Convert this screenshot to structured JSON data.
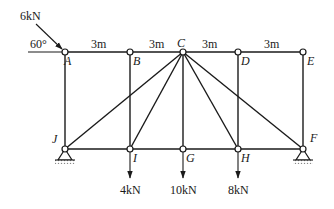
{
  "diagram": {
    "type": "truss",
    "nodes": {
      "top": [
        "A",
        "B",
        "C",
        "D",
        "E"
      ],
      "bottom": [
        "J",
        "I",
        "G",
        "H",
        "F"
      ]
    },
    "members": [
      [
        "A",
        "B"
      ],
      [
        "B",
        "C"
      ],
      [
        "C",
        "D"
      ],
      [
        "D",
        "E"
      ],
      [
        "J",
        "I"
      ],
      [
        "I",
        "G"
      ],
      [
        "G",
        "H"
      ],
      [
        "H",
        "F"
      ],
      [
        "A",
        "J"
      ],
      [
        "B",
        "I"
      ],
      [
        "C",
        "G"
      ],
      [
        "D",
        "H"
      ],
      [
        "E",
        "F"
      ],
      [
        "C",
        "J"
      ],
      [
        "C",
        "I"
      ],
      [
        "C",
        "H"
      ],
      [
        "C",
        "F"
      ]
    ],
    "spans": [
      "3m",
      "3m",
      "3m",
      "3m"
    ],
    "supports": [
      {
        "node": "J",
        "type": "pin"
      },
      {
        "node": "F",
        "type": "pin"
      }
    ],
    "loads": [
      {
        "node": "A",
        "label": "6kN",
        "angle_label": "60°",
        "direction": "inclined-down-right"
      },
      {
        "node": "I",
        "label": "4kN",
        "direction": "down"
      },
      {
        "node": "G",
        "label": "10kN",
        "direction": "down"
      },
      {
        "node": "H",
        "label": "8kN",
        "direction": "down"
      }
    ]
  }
}
